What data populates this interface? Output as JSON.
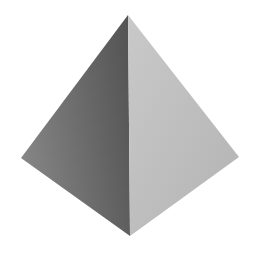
{
  "scene": {
    "subject": "pyramid",
    "background": "#ffffff",
    "vertices": {
      "apex": [
        128,
        15
      ],
      "left": [
        21,
        158
      ],
      "right": [
        239,
        157
      ],
      "bottom": [
        130,
        236
      ]
    },
    "faces": {
      "left": {
        "label": "shaded face",
        "color_light": "#8a8a8a",
        "color_dark": "#5c5c5c"
      },
      "right": {
        "label": "lit face",
        "color_light": "#c8c8c8",
        "color_dark": "#b0b0b0"
      }
    }
  }
}
